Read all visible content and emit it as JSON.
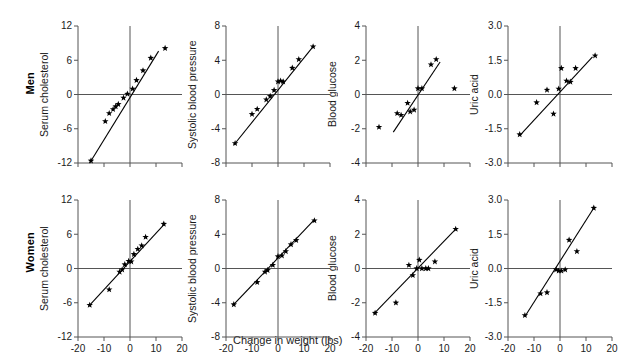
{
  "figure": {
    "xlabel": "Change in weight (lbs)",
    "rows": [
      "Men",
      "Women"
    ],
    "marker": "star",
    "axis_color": "#555555",
    "data_color": "#000000"
  },
  "chart_data": [
    {
      "type": "scatter",
      "panel": "men-serum-cholesterol",
      "row": "Men",
      "title": "",
      "xlabel": "Change in weight (lbs)",
      "ylabel": "Serum cholesterol",
      "xlim": [
        -20,
        20
      ],
      "ylim": [
        -12,
        12
      ],
      "xticks": [
        -20,
        -10,
        0,
        10,
        20
      ],
      "yticks": [
        -12,
        -6,
        0,
        6,
        12
      ],
      "xticklabels": [
        "",
        "",
        "",
        "",
        ""
      ],
      "yticklabels": [
        "-12",
        "-6",
        "0",
        "6",
        "12"
      ],
      "grid": false,
      "legend": "none",
      "x": [
        -15.0,
        -9.5,
        -8.0,
        -6.5,
        -5.5,
        -4.5,
        -2.5,
        -1.0,
        1.0,
        2.5,
        5.0,
        8.0,
        13.5
      ],
      "y": [
        -11.6,
        -4.7,
        -3.3,
        -2.6,
        -2.1,
        -1.7,
        -0.6,
        0.1,
        1.0,
        2.5,
        4.2,
        6.4,
        8.1
      ],
      "fit_line": {
        "x": [
          -15.5,
          11.0
        ],
        "y": [
          -12.0,
          7.6
        ]
      }
    },
    {
      "type": "scatter",
      "panel": "men-systolic-blood-pressure",
      "row": "Men",
      "title": "",
      "xlabel": "Change in weight (lbs)",
      "ylabel": "Systolic blood pressure",
      "xlim": [
        -20,
        20
      ],
      "ylim": [
        -8,
        8
      ],
      "xticks": [
        -20,
        -10,
        0,
        10,
        20
      ],
      "yticks": [
        -8,
        -4,
        0,
        4,
        8
      ],
      "xticklabels": [
        "",
        "",
        "",
        "",
        ""
      ],
      "yticklabels": [
        "-8",
        "-4",
        "0",
        "4",
        "8"
      ],
      "grid": false,
      "legend": "none",
      "x": [
        -16.5,
        -10.0,
        -8.0,
        -4.5,
        -3.0,
        -1.5,
        0.0,
        1.0,
        2.0,
        5.5,
        8.0,
        13.5
      ],
      "y": [
        -5.7,
        -2.3,
        -1.7,
        -0.6,
        -0.2,
        0.5,
        1.5,
        1.6,
        1.5,
        3.1,
        4.1,
        5.6
      ],
      "fit_line": {
        "x": [
          -17.0,
          13.8
        ],
        "y": [
          -5.9,
          5.7
        ]
      }
    },
    {
      "type": "scatter",
      "panel": "men-blood-glucose",
      "row": "Men",
      "title": "",
      "xlabel": "Change in weight (lbs)",
      "ylabel": "Blood glucose",
      "xlim": [
        -20,
        20
      ],
      "ylim": [
        -4,
        4
      ],
      "xticks": [
        -20,
        -10,
        0,
        10,
        20
      ],
      "yticks": [
        -4,
        -2,
        0,
        2,
        4
      ],
      "xticklabels": [
        "",
        "",
        "",
        "",
        ""
      ],
      "yticklabels": [
        "-4",
        "-2",
        "0",
        "2",
        "4"
      ],
      "grid": false,
      "legend": "none",
      "x": [
        -15.0,
        -8.0,
        -6.5,
        -4.0,
        -3.0,
        -1.5,
        0.0,
        1.5,
        5.0,
        7.0,
        14.0
      ],
      "y": [
        -1.9,
        -1.1,
        -1.2,
        -0.5,
        -1.0,
        -0.9,
        0.35,
        0.35,
        1.75,
        2.05,
        0.35
      ],
      "fit_line": {
        "x": [
          -9.5,
          8.5
        ],
        "y": [
          -2.2,
          1.9
        ]
      }
    },
    {
      "type": "scatter",
      "panel": "men-uric-acid",
      "row": "Men",
      "title": "",
      "xlabel": "Change in weight (lbs)",
      "ylabel": "Uric acid",
      "xlim": [
        -20,
        20
      ],
      "ylim": [
        -3.0,
        3.0
      ],
      "xticks": [
        -20,
        -10,
        0,
        10,
        20
      ],
      "yticks": [
        -3.0,
        -1.5,
        0.0,
        1.5,
        3.0
      ],
      "xticklabels": [
        "",
        "",
        "",
        "",
        ""
      ],
      "yticklabels": [
        "-3.0",
        "-1.5",
        "0.0",
        "1.5",
        "3.0"
      ],
      "grid": false,
      "legend": "none",
      "x": [
        -15.5,
        -9.0,
        -5.0,
        -2.5,
        -0.5,
        0.5,
        2.5,
        4.0,
        6.0,
        13.5
      ],
      "y": [
        -1.75,
        -0.35,
        0.2,
        -0.85,
        0.25,
        1.15,
        0.6,
        0.55,
        1.15,
        1.7
      ],
      "fit_line": {
        "x": [
          -15.5,
          12.5
        ],
        "y": [
          -1.8,
          1.65
        ]
      }
    },
    {
      "type": "scatter",
      "panel": "women-serum-cholesterol",
      "row": "Women",
      "title": "",
      "xlabel": "Change in weight (lbs)",
      "ylabel": "Serum cholesterol",
      "xlim": [
        -20,
        20
      ],
      "ylim": [
        -12,
        12
      ],
      "xticks": [
        -20,
        -10,
        0,
        10,
        20
      ],
      "yticks": [
        -12,
        -6,
        0,
        6,
        12
      ],
      "xticklabels": [
        "-20",
        "-10",
        "0",
        "10",
        "20"
      ],
      "yticklabels": [
        "-12",
        "-6",
        "0",
        "6",
        "12"
      ],
      "grid": false,
      "legend": "none",
      "x": [
        -15.5,
        -8.0,
        -4.0,
        -3.0,
        -2.0,
        -0.5,
        0.5,
        1.5,
        3.0,
        4.5,
        6.0,
        13.0
      ],
      "y": [
        -6.4,
        -3.7,
        -0.6,
        -0.2,
        0.7,
        1.3,
        1.2,
        2.5,
        3.4,
        4.0,
        5.5,
        7.8
      ],
      "fit_line": {
        "x": [
          -15.5,
          13.5
        ],
        "y": [
          -6.4,
          7.9
        ]
      }
    },
    {
      "type": "scatter",
      "panel": "women-systolic-blood-pressure",
      "row": "Women",
      "title": "",
      "xlabel": "Change in weight (lbs)",
      "ylabel": "Systolic blood pressure",
      "xlim": [
        -20,
        20
      ],
      "ylim": [
        -8,
        8
      ],
      "xticks": [
        -20,
        -10,
        0,
        10,
        20
      ],
      "yticks": [
        -8,
        -4,
        0,
        4,
        8
      ],
      "xticklabels": [
        "-20",
        "-10",
        "0",
        "10",
        "20"
      ],
      "yticklabels": [
        "-8",
        "-4",
        "0",
        "4",
        "8"
      ],
      "grid": false,
      "legend": "none",
      "x": [
        -17.0,
        -8.0,
        -5.0,
        -4.0,
        -2.0,
        0.0,
        1.5,
        3.0,
        5.0,
        7.0,
        14.0
      ],
      "y": [
        -4.2,
        -1.6,
        -0.4,
        -0.2,
        0.4,
        1.4,
        1.5,
        2.0,
        2.8,
        3.3,
        5.6
      ],
      "fit_line": {
        "x": [
          -17.0,
          14.0
        ],
        "y": [
          -4.2,
          5.7
        ]
      }
    },
    {
      "type": "scatter",
      "panel": "women-blood-glucose",
      "row": "Women",
      "title": "",
      "xlabel": "Change in weight (lbs)",
      "ylabel": "Blood glucose",
      "xlim": [
        -20,
        20
      ],
      "ylim": [
        -4,
        4
      ],
      "xticks": [
        -20,
        -10,
        0,
        10,
        20
      ],
      "yticks": [
        -4,
        -2,
        0,
        2,
        4
      ],
      "xticklabels": [
        "-20",
        "-10",
        "0",
        "10",
        "20"
      ],
      "yticklabels": [
        "-4",
        "-2",
        "0",
        "2",
        "4"
      ],
      "grid": false,
      "legend": "none",
      "x": [
        -16.5,
        -8.5,
        -3.5,
        -2.0,
        -0.5,
        0.5,
        1.5,
        3.0,
        4.0,
        6.5,
        14.5
      ],
      "y": [
        -2.6,
        -2.0,
        0.2,
        -0.4,
        0.0,
        0.5,
        0.0,
        0.0,
        0.0,
        0.4,
        2.3
      ],
      "fit_line": {
        "x": [
          -17.0,
          14.5
        ],
        "y": [
          -2.65,
          2.3
        ]
      }
    },
    {
      "type": "scatter",
      "panel": "women-uric-acid",
      "row": "Women",
      "title": "",
      "xlabel": "Change in weight (lbs)",
      "ylabel": "Uric acid",
      "xlim": [
        -20,
        20
      ],
      "ylim": [
        -3.0,
        3.0
      ],
      "xticks": [
        -20,
        -10,
        0,
        10,
        20
      ],
      "yticks": [
        -3.0,
        -1.5,
        0.0,
        1.5,
        3.0
      ],
      "xticklabels": [
        "-20",
        "-10",
        "0",
        "10",
        "20"
      ],
      "yticklabels": [
        "-3.0",
        "-1.5",
        "0.0",
        "1.5",
        "3.0"
      ],
      "grid": false,
      "legend": "none",
      "x": [
        -13.5,
        -7.5,
        -5.0,
        -1.5,
        -0.5,
        0.5,
        2.0,
        3.5,
        6.5,
        13.0
      ],
      "y": [
        -2.05,
        -1.1,
        -1.05,
        -0.05,
        -0.1,
        -0.1,
        -0.05,
        1.25,
        0.75,
        2.65
      ],
      "fit_line": {
        "x": [
          -13.5,
          13.0
        ],
        "y": [
          -2.1,
          2.65
        ]
      }
    }
  ]
}
